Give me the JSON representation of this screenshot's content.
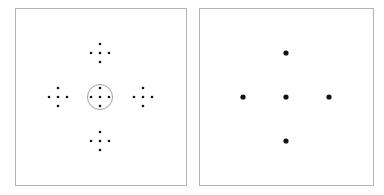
{
  "diagram": {
    "colors": {
      "border": "#b4b4b4",
      "dot": "#111111",
      "circle": "#888888",
      "background": "#ffffff"
    },
    "left_panel": {
      "description": "Five plus-shaped clusters of five small dots; center cluster enclosed by a circle",
      "cluster_spacing_px": 9,
      "small_dot_radius": 1.3,
      "clusters": [
        {
          "id": "top",
          "cx": 100,
          "cy": 53
        },
        {
          "id": "left",
          "cx": 58,
          "cy": 97
        },
        {
          "id": "center",
          "cx": 100,
          "cy": 97,
          "circled": true,
          "circle_radius": 12.5
        },
        {
          "id": "right",
          "cx": 143,
          "cy": 97
        },
        {
          "id": "bottom",
          "cx": 100,
          "cy": 141
        }
      ]
    },
    "right_panel": {
      "description": "Five large dots arranged in a plus shape",
      "large_dot_radius": 2.6,
      "dots": [
        {
          "id": "top",
          "cx": 286,
          "cy": 53
        },
        {
          "id": "left",
          "cx": 243,
          "cy": 97
        },
        {
          "id": "center",
          "cx": 286,
          "cy": 97
        },
        {
          "id": "right",
          "cx": 329,
          "cy": 97
        },
        {
          "id": "bottom",
          "cx": 286,
          "cy": 141
        }
      ]
    }
  }
}
